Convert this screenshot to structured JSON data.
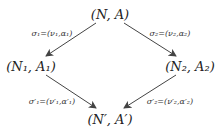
{
  "diagram": {
    "type": "commutative-diagram",
    "nodes": {
      "top": {
        "text": "(N, A)",
        "x": 110,
        "y": 14
      },
      "left": {
        "text": "(N₁, A₁)",
        "x": 31,
        "y": 66
      },
      "right": {
        "text": "(N₂, A₂)",
        "x": 190,
        "y": 66
      },
      "bottom": {
        "text": "(N′, A′)",
        "x": 110,
        "y": 119
      }
    },
    "edges": [
      {
        "from": "top",
        "to": "left",
        "label": "σ₁=(ν₁,α₁)"
      },
      {
        "from": "top",
        "to": "right",
        "label": "σ₂=(ν₂,α₂)"
      },
      {
        "from": "left",
        "to": "bottom",
        "label": "σ′₁=(ν′₁,α′₁)"
      },
      {
        "from": "right",
        "to": "bottom",
        "label": "σ′₂=(ν′₂,α′₂)"
      }
    ],
    "colors": {
      "line": "#444444",
      "text": "#222222",
      "background": "#ffffff"
    }
  }
}
